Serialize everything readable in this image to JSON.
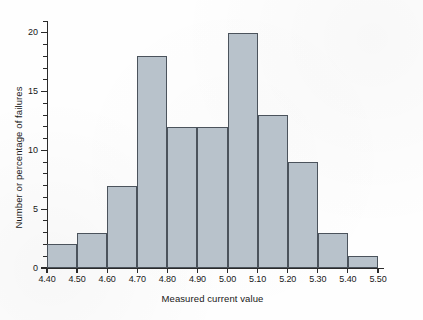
{
  "chart_data": {
    "type": "bar",
    "title": "",
    "subtitle": "",
    "xlabel": "Measured current value",
    "ylabel": "Number or percentage of failures",
    "categories": [
      "4.40-4.50",
      "4.50-4.60",
      "4.60-4.70",
      "4.70-4.80",
      "4.80-4.90",
      "4.90-5.00",
      "5.00-5.10",
      "5.10-5.20",
      "5.20-5.30",
      "5.30-5.40",
      "5.40-5.50"
    ],
    "bin_edges": [
      4.4,
      4.5,
      4.6,
      4.7,
      4.8,
      4.9,
      5.0,
      5.1,
      5.2,
      5.3,
      5.4,
      5.5
    ],
    "values": [
      2,
      3,
      7,
      18,
      12,
      12,
      20,
      13,
      9,
      3,
      1
    ],
    "xlim": [
      4.4,
      5.5
    ],
    "ylim": [
      0,
      21
    ],
    "x_tick_labels": [
      "4.40",
      "4.50",
      "4.60",
      "4.70",
      "4.80",
      "4.90",
      "5.00",
      "5.10",
      "5.20",
      "5.30",
      "5.40",
      "5.50"
    ],
    "x_tick_values": [
      4.4,
      4.5,
      4.6,
      4.7,
      4.8,
      4.9,
      5.0,
      5.1,
      5.2,
      5.3,
      5.4,
      5.5
    ],
    "y_tick_labels": [
      "0",
      "5",
      "10",
      "15",
      "20"
    ],
    "y_tick_values": [
      0,
      5,
      10,
      15,
      20
    ],
    "y_minor_tick_values": [
      1,
      2,
      3,
      4,
      6,
      7,
      8,
      9,
      11,
      12,
      13,
      14,
      16,
      17,
      18,
      19,
      21
    ],
    "grid": false,
    "legend": false,
    "legend_position": "none",
    "bar_fill_color": "#b8c2cb",
    "bar_edge_color": "#4b535c",
    "axis_color": "#2a2a2a",
    "background_color": "#fefefe",
    "text_color": "#181818"
  },
  "caption": {
    "ghost_text": ""
  }
}
